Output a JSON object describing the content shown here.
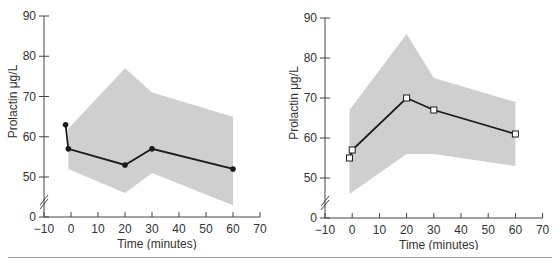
{
  "chart_data": [
    {
      "type": "line",
      "title": "",
      "xlabel": "Time (minutes)",
      "ylabel": "Prolactin μg/L",
      "xlim": [
        -10,
        70
      ],
      "ylim": [
        0,
        90
      ],
      "y_axis_break": "between 0 and 50",
      "x_ticks": [
        -10,
        0,
        10,
        20,
        30,
        40,
        50,
        60,
        70
      ],
      "y_ticks": [
        0,
        50,
        60,
        70,
        80,
        90
      ],
      "grid": false,
      "marker": "filled-circle",
      "series": [
        {
          "name": "mean",
          "x": [
            -2,
            -1,
            20,
            30,
            60
          ],
          "y": [
            63,
            57,
            53,
            57,
            52
          ]
        }
      ],
      "band": {
        "x": [
          -1,
          20,
          30,
          60
        ],
        "upper": [
          62,
          77,
          71,
          65
        ],
        "lower": [
          52,
          46,
          51,
          43
        ]
      }
    },
    {
      "type": "line",
      "title": "",
      "xlabel": "Time (minutes)",
      "ylabel": "Prolactin μg/L",
      "xlim": [
        -10,
        70
      ],
      "ylim": [
        0,
        90
      ],
      "y_axis_break": "between 0 and 50",
      "x_ticks": [
        -10,
        0,
        10,
        20,
        30,
        40,
        50,
        60,
        70
      ],
      "y_ticks": [
        0,
        50,
        60,
        70,
        80,
        90
      ],
      "grid": false,
      "marker": "open-square",
      "series": [
        {
          "name": "mean",
          "x": [
            -1,
            0,
            20,
            30,
            60
          ],
          "y": [
            55,
            57,
            70,
            67,
            61
          ]
        }
      ],
      "band": {
        "x": [
          -1,
          20,
          30,
          60
        ],
        "upper": [
          67,
          86,
          75,
          69
        ],
        "lower": [
          46,
          56,
          56,
          53
        ]
      }
    }
  ],
  "colors": {
    "band": "#cfcfcf",
    "line": "#1a1a1a",
    "axis": "#444444",
    "text": "#333333"
  },
  "labels": {
    "left": {
      "xlabel": "Time (minutes)",
      "ylabel": "Prolactin μg/L"
    },
    "right": {
      "xlabel": "Time (minutes)",
      "ylabel": "Prolactin μg/L"
    }
  }
}
